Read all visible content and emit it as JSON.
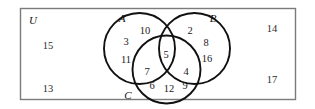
{
  "figure": {
    "type": "venn-diagram",
    "set_count": 3,
    "universe_label": "U",
    "stroke_color": "#111111",
    "rect_color": "#7b7b7b",
    "background": "#ffffff"
  },
  "sets": [
    {
      "id": "A",
      "label": "A"
    },
    {
      "id": "B",
      "label": "B"
    },
    {
      "id": "C",
      "label": "C"
    }
  ],
  "regions": {
    "A_only": {
      "name": "A only",
      "values": [
        "10",
        "3",
        "11"
      ]
    },
    "B_only": {
      "name": "B only",
      "values": [
        "2",
        "8",
        "16"
      ]
    },
    "C_only": {
      "name": "C only",
      "values": [
        "6",
        "12",
        "9"
      ]
    },
    "A_and_B": {
      "name": "A and B only",
      "values": []
    },
    "A_and_C": {
      "name": "A and C only",
      "values": [
        "7"
      ]
    },
    "B_and_C": {
      "name": "B and C only",
      "values": [
        "4"
      ]
    },
    "A_B_C": {
      "name": "A and B and C",
      "values": [
        "5"
      ]
    },
    "outside": {
      "name": "outside all sets",
      "values": [
        "15",
        "13",
        "14",
        "17"
      ]
    }
  },
  "placed_values": {
    "a_only_top": "10",
    "a_only_upper": "3",
    "a_only_lower": "11",
    "b_only_top": "2",
    "b_only_upper": "8",
    "b_only_lower": "16",
    "c_only_left": "6",
    "c_only_center": "12",
    "c_only_right": "9",
    "a_and_c": "7",
    "b_and_c": "4",
    "a_b_c": "5",
    "outside_upper_left": "15",
    "outside_lower_left": "13",
    "outside_upper_right": "14",
    "outside_lower_right": "17"
  }
}
